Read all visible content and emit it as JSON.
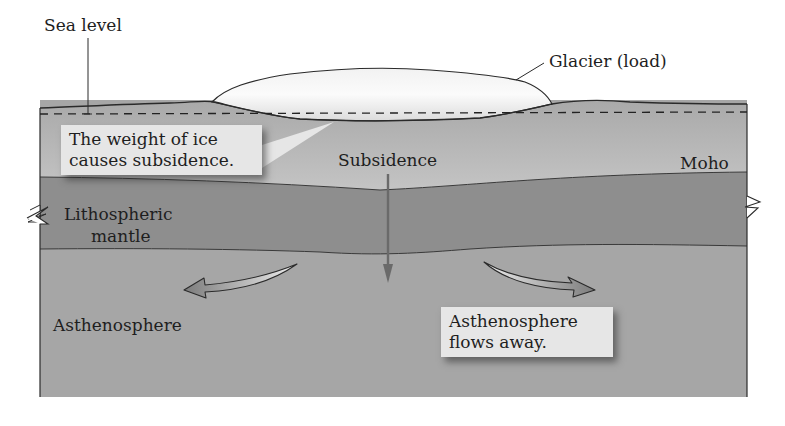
{
  "diagram": {
    "labels": {
      "sea_level": "Sea level",
      "glacier": "Glacier (load)",
      "subsidence": "Subsidence",
      "moho": "Moho",
      "lithospheric_mantle_line1": "Lithospheric",
      "lithospheric_mantle_line2": "mantle",
      "asthenosphere": "Asthenosphere"
    },
    "callouts": {
      "weight_of_ice": {
        "line1": "The weight of ice",
        "line2": "causes subsidence."
      },
      "asthenosphere_flows": {
        "line1": "Asthenosphere",
        "line2": "flows away."
      }
    },
    "layers": [
      {
        "name": "Glacier (ice)",
        "color": "#f4f4f4"
      },
      {
        "name": "Crust",
        "color": "#b9b9b9"
      },
      {
        "name": "Lithospheric mantle",
        "color": "#8e8e8e"
      },
      {
        "name": "Asthenosphere",
        "color": "#a6a6a6"
      }
    ],
    "colors": {
      "outline": "#2a2a2a",
      "subsidence_arrow": "#6a6a6a",
      "flow_arrow": "#8a8a8a",
      "callout_bg": "#e6e6e6"
    }
  }
}
